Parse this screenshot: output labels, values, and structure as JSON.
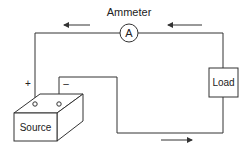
{
  "diagram": {
    "title": "Ammeter",
    "ammeter_symbol": "A",
    "load_label": "Load",
    "source_label": "Source",
    "positive_terminal": "+",
    "negative_terminal": "–",
    "arrows": [
      {
        "position": "top-left",
        "direction": "left"
      },
      {
        "position": "top-right",
        "direction": "left"
      },
      {
        "position": "bottom",
        "direction": "right"
      }
    ],
    "stroke_color": "#333333"
  }
}
